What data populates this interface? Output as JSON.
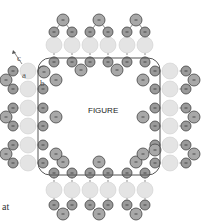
{
  "figure": {
    "center_label": "FIGURE",
    "labels": {
      "a": "a",
      "b": "b",
      "c": "c"
    },
    "caption_fragment": "at",
    "colors": {
      "pale_unit": "#e4e4e4",
      "dark_unit": "#9a9a9a",
      "outline": "#555555"
    },
    "units": {
      "top_columns": 6,
      "bottom_columns": 6,
      "left_rows": 6,
      "right_rows": 6
    }
  }
}
